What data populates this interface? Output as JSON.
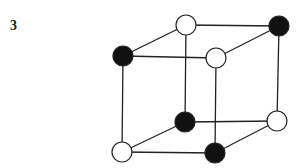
{
  "figure": {
    "label": "3"
  },
  "colors": {
    "edge": "#222222",
    "black_atom": "#111111",
    "white_atom": "#ffffff",
    "atom_outline": "#222222"
  },
  "nodes": [
    {
      "id": "top-back-left",
      "x": 186,
      "y": 25,
      "fill": "white"
    },
    {
      "id": "top-back-right",
      "x": 279,
      "y": 26,
      "fill": "black"
    },
    {
      "id": "top-front-left",
      "x": 123,
      "y": 56,
      "fill": "black"
    },
    {
      "id": "top-front-right",
      "x": 216,
      "y": 58,
      "fill": "white"
    },
    {
      "id": "bottom-back-left",
      "x": 185,
      "y": 122,
      "fill": "black"
    },
    {
      "id": "bottom-back-right",
      "x": 277,
      "y": 121,
      "fill": "white"
    },
    {
      "id": "bottom-front-left",
      "x": 122,
      "y": 152,
      "fill": "white"
    },
    {
      "id": "bottom-front-right",
      "x": 215,
      "y": 153,
      "fill": "black"
    }
  ],
  "edges": [
    [
      "top-back-left",
      "top-back-right"
    ],
    [
      "top-front-left",
      "top-front-right"
    ],
    [
      "top-back-left",
      "top-front-left"
    ],
    [
      "top-back-right",
      "top-front-right"
    ],
    [
      "bottom-back-left",
      "bottom-back-right"
    ],
    [
      "bottom-front-left",
      "bottom-front-right"
    ],
    [
      "bottom-back-left",
      "bottom-front-left"
    ],
    [
      "bottom-back-right",
      "bottom-front-right"
    ],
    [
      "top-back-left",
      "bottom-back-left"
    ],
    [
      "top-back-right",
      "bottom-back-right"
    ],
    [
      "top-front-left",
      "bottom-front-left"
    ],
    [
      "top-front-right",
      "bottom-front-right"
    ]
  ],
  "atom_radius": 10
}
